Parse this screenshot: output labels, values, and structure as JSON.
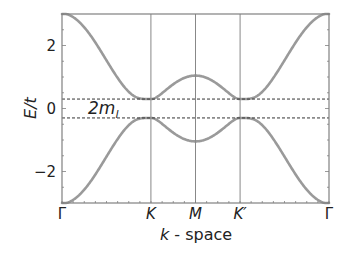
{
  "chart_data": {
    "type": "line",
    "title": "",
    "xlabel_italic": "k",
    "xlabel_rest": " - space",
    "ylabel": "E/t",
    "ylim": [
      -3,
      3
    ],
    "yticks": [
      -2,
      0,
      2
    ],
    "ytick_labels": [
      "−2",
      "0",
      "2"
    ],
    "x_high_symmetry_points": [
      {
        "label": "Γ",
        "pos": 0.0,
        "italic": false
      },
      {
        "label": "K",
        "pos": 0.333,
        "italic": true
      },
      {
        "label": "M",
        "pos": 0.5,
        "italic": true
      },
      {
        "label": "K′",
        "pos": 0.667,
        "italic": true
      },
      {
        "label": "Γ",
        "pos": 1.0,
        "italic": false
      }
    ],
    "vertical_gridlines_at": [
      "K",
      "M",
      "K′"
    ],
    "gap_lines": [
      0.3,
      -0.3
    ],
    "gap_annotation": {
      "main": "2m",
      "sub": "l"
    },
    "mass_gap_m": 0.3,
    "series": [
      {
        "name": "upper band",
        "points": [
          {
            "k": "Γ",
            "E": 3.0
          },
          {
            "k": "K",
            "E": 0.3
          },
          {
            "k": "M",
            "E": 1.04
          },
          {
            "k": "K′",
            "E": 0.3
          },
          {
            "k": "Γ",
            "E": 3.0
          }
        ]
      },
      {
        "name": "lower band",
        "points": [
          {
            "k": "Γ",
            "E": -3.0
          },
          {
            "k": "K",
            "E": -0.3
          },
          {
            "k": "M",
            "E": -1.04
          },
          {
            "k": "K′",
            "E": -0.3
          },
          {
            "k": "Γ",
            "E": -3.0
          }
        ]
      }
    ],
    "grid": false,
    "legend": null,
    "colors": {
      "band": "#9a9a9a",
      "frame": "#808080",
      "gridline": "#888888",
      "dashed": "#333333"
    }
  }
}
